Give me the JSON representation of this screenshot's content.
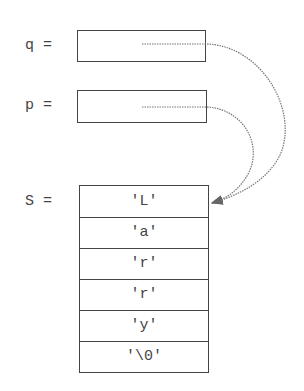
{
  "diagram": {
    "type": "pointer-memory-diagram",
    "variables": [
      {
        "name": "q",
        "label": "q =",
        "points_to": "S[0]"
      },
      {
        "name": "p",
        "label": "p =",
        "points_to": "S[0]"
      }
    ],
    "array": {
      "name": "S",
      "label": "S =",
      "cells": [
        "'L'",
        "'a'",
        "'r'",
        "'r'",
        "'y'",
        "'\\0'"
      ]
    },
    "colors": {
      "line": "#444444",
      "arrow": "#777777",
      "background": "#ffffff"
    }
  }
}
